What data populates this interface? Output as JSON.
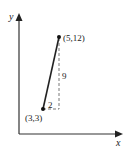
{
  "diagram": {
    "axes": {
      "x_label": "x",
      "y_label": "y"
    },
    "points": [
      {
        "label": "(3,3)",
        "x": 3,
        "y": 3
      },
      {
        "label": "(5,12)",
        "x": 5,
        "y": 12
      }
    ],
    "rise_label": "9",
    "run_label": "2",
    "colors": {
      "axis": "#333333",
      "segment": "#222222",
      "dashed": "#555555",
      "text": "#222222"
    }
  }
}
